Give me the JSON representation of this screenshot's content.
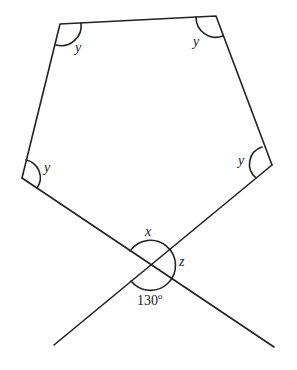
{
  "diagram": {
    "labels": {
      "angle_top_left": "y",
      "angle_top_right": "y",
      "angle_left": "y",
      "angle_right": "y",
      "angle_top_at_crossing": "x",
      "angle_right_at_crossing": "z",
      "angle_bottom_at_crossing": "130",
      "degree_mark": "o"
    },
    "stroke_color": "#222222",
    "background": "#ffffff"
  }
}
